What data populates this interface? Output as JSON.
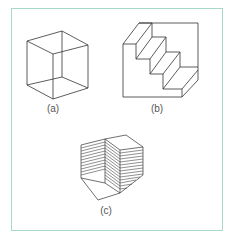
{
  "figure": {
    "frame_color": "#a8d8c8",
    "line_color": "#333333",
    "panels": [
      {
        "id": "a",
        "label": "(a)",
        "description": "Necker cube wireframe"
      },
      {
        "id": "b",
        "label": "(b)",
        "description": "Schroeder staircase"
      },
      {
        "id": "c",
        "label": "(c)",
        "description": "Ambiguous stacked-sheets block"
      }
    ]
  }
}
